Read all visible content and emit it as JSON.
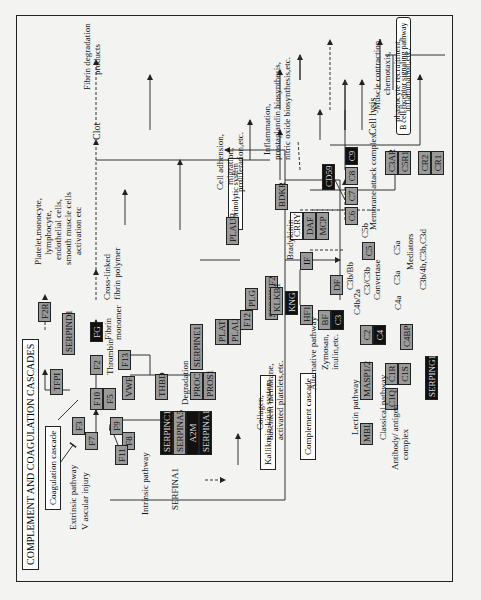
{
  "title": "COMPLEMENT AND COAGULATION CASCADES",
  "sections": {
    "coagulation": "Coagulation cascade",
    "kallikrein": "Kallikrein-kinin system",
    "complement": "Complement cascade",
    "fibrinolytic": "Fibrinolytic system",
    "bcell": "B cell receptor signaling pathway"
  },
  "genes": {
    "F3": "F3",
    "F7": "F7",
    "F9": "F9",
    "F8": "F8",
    "VWF": "VWF",
    "F11": "F11",
    "F10": "F10",
    "F5": "F5",
    "F2": "F2",
    "TFPI": "TFPI",
    "SERPIND1": "SERPIND1",
    "FG": "FG",
    "F13": "F13",
    "F2R": "F2R",
    "THBD": "THBD",
    "PROC": "PROC",
    "PROS1": "PROS1",
    "SERPINC1": "SERPINC1",
    "SERPINA5": "SERPINA5",
    "A2M": "A2M",
    "SERPINA1": "SERPINA1",
    "SERPINE1": "SERPINE1",
    "PLAT": "PLAT",
    "PLAU": "PLAU",
    "PLG": "PLG",
    "SERPINF2": "SERPINF2",
    "PLAUR": "PLAUR",
    "KLKB1": "KLKB1",
    "KNG": "KNG",
    "F12": "F12",
    "BDKR": "BDKR",
    "HF1": "HF1",
    "BF": "BF",
    "C3": "C3",
    "DF": "DF",
    "IF": "IF",
    "CRRY": "CRRY",
    "DAF": "DAF",
    "MCP": "MCP",
    "C5": "C5",
    "C6": "C6",
    "C7": "C7",
    "C8": "C8",
    "C9": "C9",
    "CD59": "CD59",
    "C2": "C2",
    "C4": "C4",
    "C4BP": "C4BP",
    "MASP12": "MASP1/2",
    "MBL": "MBL",
    "C1R": "C1R",
    "C1S": "C1S",
    "C1Q": "C1Q",
    "SERPING1": "SERPING1",
    "C3AR": "C3AR",
    "C5R1": "C5R1",
    "CR2": "CR2",
    "CR1": "CR1"
  },
  "labels": {
    "extrinsic": "Extrinsic pathway",
    "vascular": "V ascular injury",
    "intrinsic": "Intrinsic pathway",
    "serpina1": "SERFINA1",
    "thrombin": "Thrombin",
    "degradation": "Degradation",
    "fibrin_monomer_1": "Fibrin",
    "fibrin_monomer_2": "monomer",
    "crosslinked_1": "Cross-linked",
    "crosslinked_2": "fibrin polymer",
    "clot": "Clot",
    "fdp_1": "Fibrin degradation",
    "fdp_2": "products",
    "platelet_1": "Platelet,monocyte,",
    "platelet_2": "lymphocyte,",
    "platelet_3": "endothelial cells,",
    "platelet_4": "smooth muscle cells",
    "platelet_5": "activation etc",
    "celladh_1": "Cell adhension,",
    "celladh_2": "migration,",
    "celladh_3": "proliferation,etc.",
    "bradykinin": "Bradykinin",
    "inflam_1": "Inflammation,",
    "inflam_2": "prostaglandin biosynthesis,",
    "inflam_3": "nitric oxide biosynthesis,etc.",
    "collagen_1": "Collagen,",
    "collagen_2": "basement membrane,",
    "collagen_3": "activated platelets,etc.",
    "alternative": "Alternative pathway",
    "zymosan_1": "Zymosan,",
    "zymosan_2": "inulin,etc.",
    "lectin": "Lectin pathway",
    "classical": "Classical pathway",
    "antibody_1": "Antibody/ antigen",
    "antibody_2": "complex",
    "c3b_bb": "C3b/Bb",
    "c4b_2a": "C4b/2a",
    "convertase_1": "C3/C3b",
    "convertase_2": "Convertase",
    "c4a": "C4a",
    "c3a": "C3a",
    "c5a": "C5a",
    "c5b": "C5b",
    "mediators": "Mediators",
    "c3b_list": "C3b/4b,C3b,C3d",
    "mac": "Membrane attack complex",
    "cell_lysis": "Cell lysis",
    "muscle_1": "Muscle contraction,",
    "muscle_2": "chemotaxis,",
    "muscle_3": "phagocyte recruitment,",
    "muscle_4": "inflammation,etc."
  }
}
